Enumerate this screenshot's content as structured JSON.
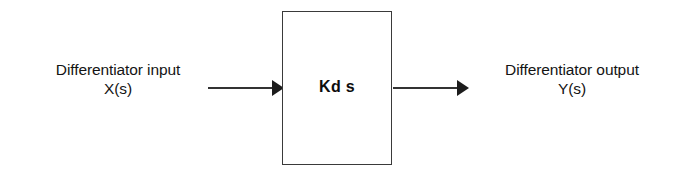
{
  "diagram": {
    "type": "block-diagram",
    "input": {
      "label_line1": "Differentiator input",
      "label_line2": "X(s)",
      "arrow": "right-arrow"
    },
    "block": {
      "label": "Kd s",
      "shape": "rectangle",
      "border_color": "#3a3a3a"
    },
    "output": {
      "label_line1": "Differentiator output",
      "label_line2": "Y(s)",
      "arrow": "right-arrow"
    },
    "colors": {
      "background": "#ffffff",
      "ink": "#141414",
      "arrow": "#1c1c1c"
    }
  }
}
